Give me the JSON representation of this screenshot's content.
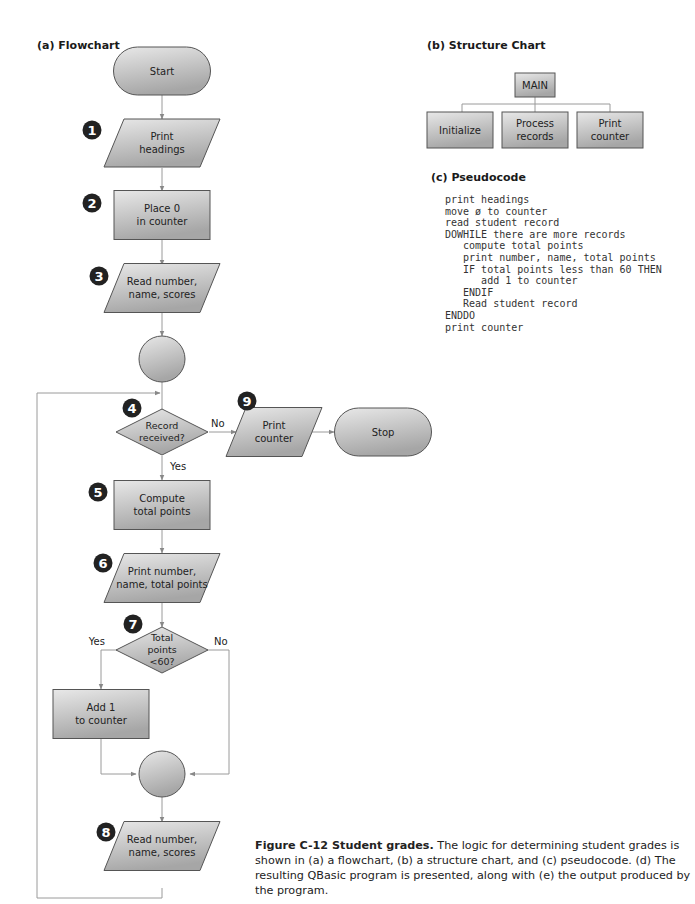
{
  "sections": {
    "flowchart_title": "(a) Flowchart",
    "structure_title": "(b) Structure Chart",
    "pseudocode_title": "(c) Pseudocode"
  },
  "flowchart": {
    "start": "Start",
    "stop": "Stop",
    "steps": [
      {
        "badge": "1",
        "lines": [
          "Print",
          "headings"
        ],
        "shape": "io"
      },
      {
        "badge": "2",
        "lines": [
          "Place 0",
          "in counter"
        ],
        "shape": "process"
      },
      {
        "badge": "3",
        "lines": [
          "Read number,",
          "name, scores"
        ],
        "shape": "io"
      },
      {
        "badge": "4",
        "lines": [
          "Record",
          "received?"
        ],
        "shape": "decision"
      },
      {
        "badge": "5",
        "lines": [
          "Compute",
          "total points"
        ],
        "shape": "process"
      },
      {
        "badge": "6",
        "lines": [
          "Print number,",
          "name, total points"
        ],
        "shape": "io"
      },
      {
        "badge": "7",
        "lines": [
          "Total",
          "points",
          "<60?"
        ],
        "shape": "decision"
      },
      {
        "badge": "",
        "lines": [
          "Add 1",
          "to counter"
        ],
        "shape": "process"
      },
      {
        "badge": "8",
        "lines": [
          "Read number,",
          "name, scores"
        ],
        "shape": "io"
      },
      {
        "badge": "9",
        "lines": [
          "Print",
          "counter"
        ],
        "shape": "io"
      }
    ],
    "labels": {
      "no_4": "No",
      "yes_4": "Yes",
      "yes_7": "Yes",
      "no_7": "No"
    }
  },
  "structure_chart": {
    "root": "MAIN",
    "children": [
      {
        "lines": [
          "Initialize"
        ]
      },
      {
        "lines": [
          "Process",
          "records"
        ]
      },
      {
        "lines": [
          "Print",
          "counter"
        ]
      }
    ]
  },
  "pseudocode": {
    "lines": [
      "print headings",
      "move ø to counter",
      "read student record",
      "DOWHILE there are more records",
      "   compute total points",
      "   print number, name, total points",
      "   IF total points less than 60 THEN",
      "      add 1 to counter",
      "   ENDIF",
      "   Read student record",
      "ENDDO",
      "print counter"
    ]
  },
  "caption": {
    "bold": "Figure C-12 Student grades.",
    "text": "  The logic for determining student grades is shown in (a) a flowchart, (b) a structure chart, and (c) pseudocode. (d) The resulting QBasic program is presented, along with (e) the output produced by the program."
  },
  "colors": {
    "shape_fill_top": "#e6e6e6",
    "shape_fill_bottom": "#a9a9a9",
    "stroke": "#555555",
    "line": "#9a9a9a",
    "badge": "#222222"
  }
}
